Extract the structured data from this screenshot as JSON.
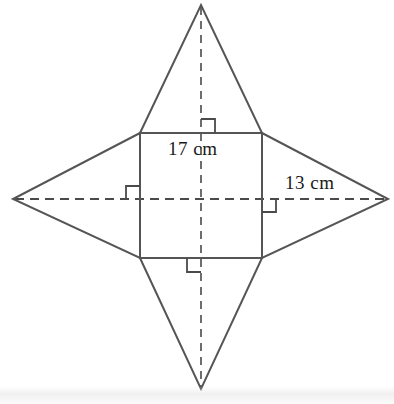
{
  "figure": {
    "background_color": "#ffffff",
    "stroke_color": "#4a4a4a",
    "text_color": "#1a1a1a",
    "labels": {
      "base_edge": "17 cm",
      "slant_height": "13 cm"
    },
    "shapes": {
      "square": {
        "name": "pyramid-base-square",
        "left": 140,
        "top": 133,
        "right": 262,
        "bottom": 258
      },
      "apexes": {
        "top": {
          "x": 201,
          "y": 5
        },
        "bottom": {
          "x": 201,
          "y": 389
        },
        "left": {
          "x": 13,
          "y": 199
        },
        "right": {
          "x": 388,
          "y": 199
        }
      }
    },
    "right_angle_marks": [
      {
        "name": "right-angle-mark-top",
        "x": 201,
        "y": 133
      },
      {
        "name": "right-angle-mark-left",
        "x": 140,
        "y": 199
      },
      {
        "name": "right-angle-mark-right",
        "x": 262,
        "y": 199
      },
      {
        "name": "right-angle-mark-bottom",
        "x": 201,
        "y": 258
      }
    ],
    "dashed_lines": [
      {
        "name": "altitude-dashed-vertical",
        "from": [
          201,
          5
        ],
        "to": [
          201,
          389
        ]
      },
      {
        "name": "altitude-dashed-horizontal",
        "from": [
          13,
          199
        ],
        "to": [
          388,
          199
        ]
      }
    ]
  }
}
